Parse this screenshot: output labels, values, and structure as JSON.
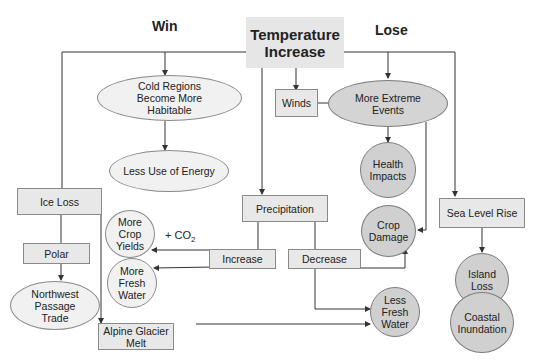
{
  "headings": {
    "win": "Win",
    "lose": "Lose"
  },
  "nodes": {
    "root": "Temperature Increase",
    "cold_regions": "Cold Regions Become More Habitable",
    "less_energy": "Less Use of Energy",
    "winds": "Winds",
    "extreme_events": "More Extreme Events",
    "health": "Health Impacts",
    "crop_damage": "Crop Damage",
    "ice_loss": "Ice Loss",
    "polar": "Polar",
    "northwest": "Northwest Passage Trade",
    "alpine": "Alpine Glacier Melt",
    "precipitation": "Precipitation",
    "increase": "Increase",
    "decrease": "Decrease",
    "more_crop": "More Crop Yields",
    "more_water": "More Fresh Water",
    "less_water": "Less Fresh Water",
    "sea_level": "Sea Level Rise",
    "island_loss": "Island Loss",
    "coastal": "Coastal Inundation"
  },
  "annotations": {
    "co2_prefix": "+ CO",
    "co2_sub": "2"
  },
  "colors": {
    "rect_fill": "#e8e8e8",
    "light_fill": "#f1f1f1",
    "dark_fill": "#d0d0d0",
    "line": "#333333"
  }
}
